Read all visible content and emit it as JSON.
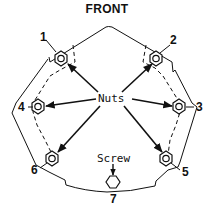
{
  "title": "FRONT",
  "labels": {
    "nuts": "Nuts",
    "screw": "Screw"
  },
  "callouts": [
    {
      "id": "1",
      "x": 14,
      "y": 41
    },
    {
      "id": "2",
      "x": 174,
      "y": 45
    },
    {
      "id": "3",
      "x": 199,
      "y": 109
    },
    {
      "id": "4",
      "x": 2,
      "y": 111
    },
    {
      "id": "5",
      "x": 186,
      "y": 175
    },
    {
      "id": "6",
      "x": 32,
      "y": 177
    },
    {
      "id": "7",
      "x": 111,
      "y": 198
    }
  ],
  "colors": {
    "line": "#111111",
    "background": "#ffffff"
  }
}
